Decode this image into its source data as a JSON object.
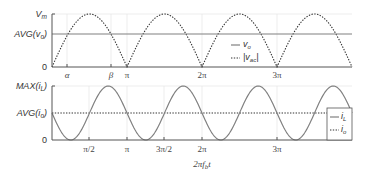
{
  "chart_data": [
    {
      "type": "line",
      "title": "",
      "xlabel": "",
      "ylabel": "",
      "y_tick_labels": [
        "V_m",
        "AVG(v_o)",
        "0"
      ],
      "x_tick_labels": [
        "α",
        "β",
        "π",
        "2π",
        "3π"
      ],
      "x_range_rad": [
        0,
        12.566
      ],
      "ylim": [
        0,
        1
      ],
      "grid": true,
      "legend": {
        "position": "center-right",
        "entries": [
          {
            "label": "v_o",
            "style": "solid"
          },
          {
            "label": "|v_ac|",
            "style": "dotted"
          }
        ]
      },
      "series": [
        {
          "name": "v_o",
          "style": "solid",
          "description": "constant at AVG(v_o)",
          "x": [
            0,
            12.566
          ],
          "y": [
            0.62,
            0.62
          ]
        },
        {
          "name": "|v_ac|",
          "style": "dotted",
          "description": "full-wave rectified sine, peak V_m at π/2 + kπ, zero at kπ",
          "x": [
            0,
            1.571,
            3.1416,
            4.712,
            6.283,
            7.854,
            9.425,
            10.996,
            12.566
          ],
          "y": [
            0,
            1,
            0,
            1,
            0,
            1,
            0,
            1,
            0
          ]
        }
      ]
    },
    {
      "type": "line",
      "title": "",
      "xlabel": "2πf_b t",
      "ylabel": "",
      "y_tick_labels": [
        "MAX(i_L)",
        "AVG(i_o)",
        "0"
      ],
      "x_tick_labels": [
        "π/2",
        "π",
        "3π/2",
        "2π",
        "3π"
      ],
      "x_range_rad": [
        0,
        12.566
      ],
      "ylim": [
        0,
        1
      ],
      "grid": true,
      "legend": {
        "position": "lower-right",
        "entries": [
          {
            "label": "i_L",
            "style": "solid"
          },
          {
            "label": "i_o",
            "style": "dotted"
          }
        ]
      },
      "series": [
        {
          "name": "i_L",
          "style": "solid",
          "description": "AVG − AVG·sin(2θ); minima 0 at π/4 + kπ, maxima MAX at 3π/4 + kπ",
          "x": [
            0,
            0.785,
            1.571,
            2.356,
            3.1416,
            3.927,
            4.712,
            5.498,
            6.283,
            7.069,
            7.854,
            8.639,
            9.425,
            10.21,
            10.996,
            11.781,
            12.566
          ],
          "y": [
            0.5,
            0,
            0.5,
            1,
            0.5,
            0,
            0.5,
            1,
            0.5,
            0,
            0.5,
            1,
            0.5,
            0,
            0.5,
            1,
            0.5
          ]
        },
        {
          "name": "i_o",
          "style": "dotted",
          "description": "constant at AVG(i_o)",
          "x": [
            0,
            12.566
          ],
          "y": [
            0.5,
            0.5
          ]
        }
      ]
    }
  ],
  "top_plot": {
    "y_labels": {
      "vm": "V",
      "vm_sub": "m",
      "avg": "AVG(v",
      "avg_sub": "o",
      "avg_close": ")",
      "zero": "0"
    },
    "x_labels": {
      "alpha": "α",
      "beta": "β",
      "pi": "π",
      "two_pi": "2π",
      "three_pi": "3π"
    },
    "legend": {
      "vo": "v",
      "vo_sub": "o",
      "vac_open": "|v",
      "vac_sub": "ac",
      "vac_close": "|"
    }
  },
  "bottom_plot": {
    "y_labels": {
      "max": "MAX(i",
      "max_sub": "L",
      "max_close": ")",
      "avg": "AVG(i",
      "avg_sub": "o",
      "avg_close": ")",
      "zero": "0"
    },
    "x_labels": {
      "half_pi": "π/2",
      "pi": "π",
      "three_half_pi": "3π/2",
      "two_pi": "2π",
      "three_pi": "3π"
    },
    "legend": {
      "il": "i",
      "il_sub": "L",
      "io": "i",
      "io_sub": "o"
    },
    "xlabel": {
      "pre": "2πf",
      "sub": "b",
      "post": "t"
    }
  }
}
